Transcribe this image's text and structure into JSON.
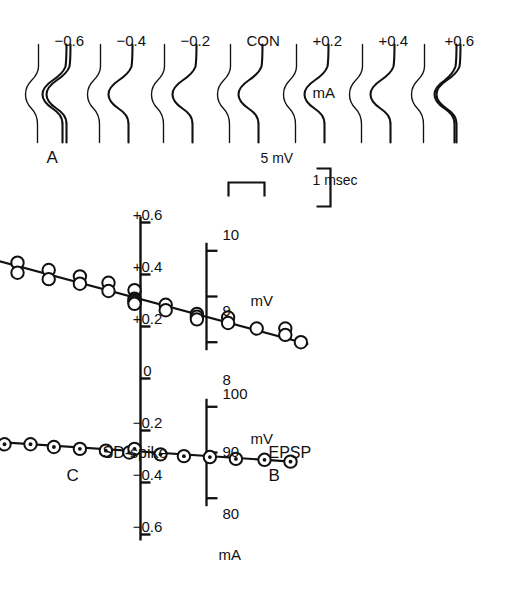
{
  "figure": {
    "panels": [
      {
        "id": "A",
        "letter": "A"
      },
      {
        "id": "B",
        "letter": "B",
        "series_label": "EPSP"
      },
      {
        "id": "C",
        "letter": "C",
        "series_label": "SD-spike"
      }
    ],
    "panelA": {
      "letter": "A",
      "trace_labels": [
        "+0.6",
        "+0.4",
        "+0.2",
        "CON",
        "−0.2",
        "−0.4",
        "−0.6"
      ],
      "current_unit": "mA",
      "scale_voltage": "5 mV",
      "scale_time": "1 msec"
    },
    "xaxis": {
      "unit": "mA",
      "ticks": [
        "+0.6",
        "+0.4",
        "+0.2",
        "0",
        "−0.2",
        "−0.4",
        "−0.6"
      ]
    },
    "panelB_axis": {
      "unit": "mV",
      "ticks": [
        "10",
        "9",
        "8"
      ]
    },
    "panelC_axis": {
      "unit": "mV",
      "ticks": [
        "100",
        "90",
        "80"
      ]
    }
  },
  "chart_data": [
    {
      "type": "scatter",
      "title": "",
      "panel": "B",
      "series_name": "EPSP",
      "xlabel": "mA",
      "ylabel": "mV",
      "xlim": [
        -0.7,
        0.7
      ],
      "ylim": [
        7.6,
        10.4
      ],
      "xticks": [
        0.6,
        0.4,
        0.2,
        0,
        -0.2,
        -0.4,
        -0.6
      ],
      "xticklabels": [
        "+0.6",
        "+0.4",
        "+0.2",
        "0",
        "−0.2",
        "−0.4",
        "−0.6"
      ],
      "yticks": [
        10,
        9,
        8
      ],
      "yticklabels": [
        "10",
        "9",
        "8"
      ],
      "grid": false,
      "marker": "open-circle",
      "points": [
        {
          "x": -0.6,
          "y": 9.98
        },
        {
          "x": -0.6,
          "y": 9.72
        },
        {
          "x": -0.45,
          "y": 9.74
        },
        {
          "x": -0.45,
          "y": 9.52
        },
        {
          "x": -0.33,
          "y": 9.58
        },
        {
          "x": -0.33,
          "y": 9.38
        },
        {
          "x": -0.21,
          "y": 9.44
        },
        {
          "x": -0.21,
          "y": 9.28
        },
        {
          "x": -0.1,
          "y": 9.3
        },
        {
          "x": -0.1,
          "y": 9.12
        },
        {
          "x": 0.0,
          "y": 9.14
        },
        {
          "x": 0.0,
          "y": 8.95
        },
        {
          "x": 0.0,
          "y": 8.92
        },
        {
          "x": 0.0,
          "y": 8.88
        },
        {
          "x": 0.0,
          "y": 8.84
        },
        {
          "x": 0.12,
          "y": 8.82
        },
        {
          "x": 0.12,
          "y": 8.7
        },
        {
          "x": 0.24,
          "y": 8.62
        },
        {
          "x": 0.24,
          "y": 8.56
        },
        {
          "x": 0.24,
          "y": 8.5
        },
        {
          "x": 0.36,
          "y": 8.54
        },
        {
          "x": 0.36,
          "y": 8.42
        },
        {
          "x": 0.47,
          "y": 8.3
        },
        {
          "x": 0.58,
          "y": 8.3
        },
        {
          "x": 0.58,
          "y": 8.16
        },
        {
          "x": 0.64,
          "y": 8.0
        }
      ],
      "fit_line": {
        "x0": -0.655,
        "y0": 9.98,
        "x1": 0.665,
        "y1": 7.96
      }
    },
    {
      "type": "scatter",
      "title": "",
      "panel": "C",
      "series_name": "SD-spike",
      "xlabel": "mA",
      "ylabel": "mV",
      "xlim": [
        -0.7,
        0.7
      ],
      "ylim": [
        76,
        104
      ],
      "xticks": [
        0.6,
        0.4,
        0.2,
        0,
        -0.2,
        -0.4,
        -0.6
      ],
      "xticklabels": [
        "+0.6",
        "+0.4",
        "+0.2",
        "0",
        "−0.2",
        "−0.4",
        "−0.6"
      ],
      "yticks": [
        100,
        90,
        80
      ],
      "yticklabels": [
        "100",
        "90",
        "80"
      ],
      "grid": false,
      "marker": "dot-in-circle",
      "points": [
        {
          "x": -0.62,
          "y": 92.6
        },
        {
          "x": -0.5,
          "y": 91.8
        },
        {
          "x": -0.4,
          "y": 91.8
        },
        {
          "x": -0.31,
          "y": 91.2
        },
        {
          "x": -0.21,
          "y": 90.8
        },
        {
          "x": -0.11,
          "y": 90.4
        },
        {
          "x": -0.02,
          "y": 90.0
        },
        {
          "x": 0.0,
          "y": 90.8
        },
        {
          "x": 0.1,
          "y": 89.6
        },
        {
          "x": 0.19,
          "y": 89.2
        },
        {
          "x": 0.29,
          "y": 89.0
        },
        {
          "x": 0.39,
          "y": 88.6
        },
        {
          "x": 0.5,
          "y": 88.4
        },
        {
          "x": 0.6,
          "y": 88.0
        }
      ],
      "fit_line": {
        "x0": -0.625,
        "y0": 92.7,
        "x1": 0.605,
        "y1": 88.0
      }
    }
  ]
}
